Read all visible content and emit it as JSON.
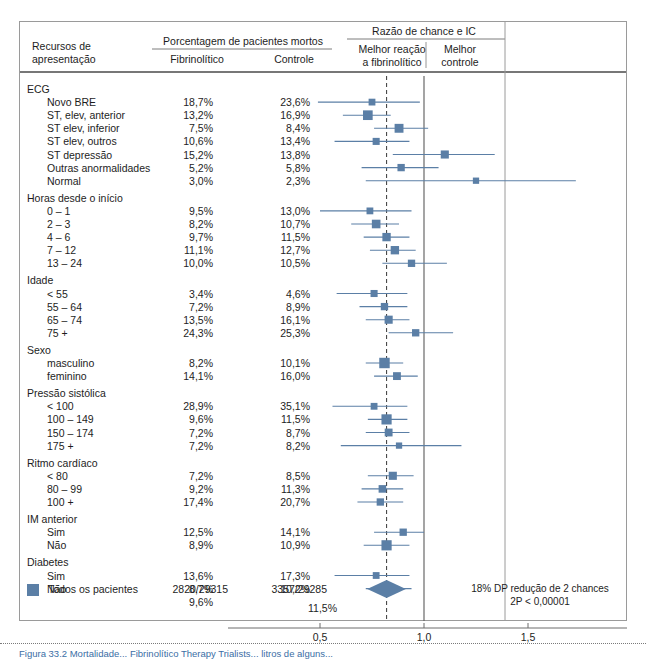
{
  "figure": {
    "type": "forest-plot",
    "accent_color": "#5b7fa6",
    "caption_partial": "Figura 33.2 Mortalidade... Fibrinolítico Therapy Trialists... litros de alguns..."
  },
  "headers": {
    "col_subject_line1": "Recursos de",
    "col_subject_line2": "apresentação",
    "pct_group": "Porcentagem de pacientes mortos",
    "pct_fibrino": "Fibrinolítico",
    "pct_control": "Controle",
    "or_group": "Razão de chance e IC",
    "or_left_line1": "Melhor reação",
    "or_left_line2": "a fibrinolítico",
    "or_right_line1": "Melhor",
    "or_right_line2": "controle"
  },
  "axis": {
    "ticks": [
      "0,5",
      "1,0",
      "1,5"
    ],
    "tick_values": [
      0.5,
      1.0,
      1.5
    ],
    "null_line": 1.0,
    "pooled_line": 0.82
  },
  "summary": {
    "legend_label": "Todos os pacientes",
    "fibrino_counts": "2820/29315",
    "control_counts": "3357/29285",
    "fibrino_pct": "9,6%",
    "control_pct": "11,5%",
    "note_line1": "18% DP redução de 2 chances",
    "note_line2": "2P < 0,00001",
    "or": 0.82,
    "ci_low": 0.78,
    "ci_high": 0.86
  },
  "chart_data": {
    "type": "forest",
    "title": "Razão de chance e IC",
    "xlabel": "",
    "ylabel": "",
    "xlim": [
      0.25,
      1.75
    ],
    "xticks": [
      0.5,
      1.0,
      1.5
    ],
    "xtick_labels": [
      "0,5",
      "1,0",
      "1,5"
    ],
    "grid": false,
    "legend": "none",
    "columns": [
      "Recursos de apresentação",
      "Fibrinolítico",
      "Controle",
      "Razão de chance e IC"
    ],
    "groups": [
      {
        "name": "ECG",
        "rows": [
          {
            "label": "Novo BRE",
            "fibrino": "18,7%",
            "control": "23,6%",
            "or": 0.75,
            "ci_low": 0.49,
            "ci_high": 0.98,
            "weight": 1.0
          },
          {
            "label": "ST, elev, anterior",
            "fibrino": "13,2%",
            "control": "16,9%",
            "or": 0.73,
            "ci_low": 0.61,
            "ci_high": 0.84,
            "weight": 2.1
          },
          {
            "label": "ST elev, inferior",
            "fibrino": "7,5%",
            "control": "8,4%",
            "or": 0.88,
            "ci_low": 0.76,
            "ci_high": 1.02,
            "weight": 1.8
          },
          {
            "label": "ST elev, outros",
            "fibrino": "10,6%",
            "control": "13,4%",
            "or": 0.77,
            "ci_low": 0.57,
            "ci_high": 0.93,
            "weight": 1.1
          },
          {
            "label": "ST depressão",
            "fibrino": "15,2%",
            "control": "13,8%",
            "or": 1.1,
            "ci_low": 0.85,
            "ci_high": 1.34,
            "weight": 1.5
          },
          {
            "label": "Outras anormalidades",
            "fibrino": "5,2%",
            "control": "5,8%",
            "or": 0.89,
            "ci_low": 0.7,
            "ci_high": 1.07,
            "weight": 1.2
          },
          {
            "label": "Normal",
            "fibrino": "3,0%",
            "control": "2,3%",
            "or": 1.25,
            "ci_low": 0.72,
            "ci_high": 1.73,
            "weight": 0.8
          }
        ]
      },
      {
        "name": "Horas desde o início",
        "rows": [
          {
            "label": "0 – 1",
            "fibrino": "9,5%",
            "control": "13,0%",
            "or": 0.74,
            "ci_low": 0.5,
            "ci_high": 0.94,
            "weight": 1.0
          },
          {
            "label": "2 – 3",
            "fibrino": "8,2%",
            "control": "10,7%",
            "or": 0.77,
            "ci_low": 0.65,
            "ci_high": 0.88,
            "weight": 1.7
          },
          {
            "label": "4 – 6",
            "fibrino": "9,7%",
            "control": "11,5%",
            "or": 0.82,
            "ci_low": 0.71,
            "ci_high": 0.93,
            "weight": 1.6
          },
          {
            "label": "7 – 12",
            "fibrino": "11,1%",
            "control": "12,7%",
            "or": 0.86,
            "ci_low": 0.74,
            "ci_high": 0.96,
            "weight": 1.6
          },
          {
            "label": "13 – 24",
            "fibrino": "10,0%",
            "control": "10,5%",
            "or": 0.94,
            "ci_low": 0.8,
            "ci_high": 1.11,
            "weight": 1.2
          }
        ]
      },
      {
        "name": "Idade",
        "rows": [
          {
            "label": "< 55",
            "fibrino": "3,4%",
            "control": "4,6%",
            "or": 0.76,
            "ci_low": 0.58,
            "ci_high": 0.92,
            "weight": 1.1
          },
          {
            "label": "55 – 64",
            "fibrino": "7,2%",
            "control": "8,9%",
            "or": 0.81,
            "ci_low": 0.69,
            "ci_high": 0.92,
            "weight": 1.2
          },
          {
            "label": "65 – 74",
            "fibrino": "13,5%",
            "control": "16,1%",
            "or": 0.83,
            "ci_low": 0.72,
            "ci_high": 0.93,
            "weight": 1.5
          },
          {
            "label": "75 +",
            "fibrino": "24,3%",
            "control": "25,3%",
            "or": 0.96,
            "ci_low": 0.83,
            "ci_high": 1.14,
            "weight": 1.2
          }
        ]
      },
      {
        "name": "Sexo",
        "rows": [
          {
            "label": "masculino",
            "fibrino": "8,2%",
            "control": "10,1%",
            "or": 0.81,
            "ci_low": 0.72,
            "ci_high": 0.9,
            "weight": 2.4
          },
          {
            "label": "feminino",
            "fibrino": "14,1%",
            "control": "16,0%",
            "or": 0.87,
            "ci_low": 0.76,
            "ci_high": 0.97,
            "weight": 1.4
          }
        ]
      },
      {
        "name": "Pressão sistólica",
        "rows": [
          {
            "label": "< 100",
            "fibrino": "28,9%",
            "control": "35,1%",
            "or": 0.76,
            "ci_low": 0.56,
            "ci_high": 0.92,
            "weight": 1.0
          },
          {
            "label": "100 – 149",
            "fibrino": "9,6%",
            "control": "11,5%",
            "or": 0.82,
            "ci_low": 0.73,
            "ci_high": 0.92,
            "weight": 2.3
          },
          {
            "label": "150 – 174",
            "fibrino": "7,2%",
            "control": "8,7%",
            "or": 0.83,
            "ci_low": 0.72,
            "ci_high": 0.93,
            "weight": 1.4
          },
          {
            "label": "175 +",
            "fibrino": "7,2%",
            "control": "8,2%",
            "or": 0.88,
            "ci_low": 0.6,
            "ci_high": 1.18,
            "weight": 0.8
          }
        ]
      },
      {
        "name": "Ritmo cardíaco",
        "rows": [
          {
            "label": "< 80",
            "fibrino": "7,2%",
            "control": "8,5%",
            "or": 0.85,
            "ci_low": 0.73,
            "ci_high": 0.95,
            "weight": 1.5
          },
          {
            "label": "80 – 99",
            "fibrino": "9,2%",
            "control": "11,3%",
            "or": 0.8,
            "ci_low": 0.7,
            "ci_high": 0.9,
            "weight": 1.3
          },
          {
            "label": "100 +",
            "fibrino": "17,4%",
            "control": "20,7%",
            "or": 0.79,
            "ci_low": 0.68,
            "ci_high": 0.9,
            "weight": 1.2
          }
        ]
      },
      {
        "name": "IM anterior",
        "rows": [
          {
            "label": "Sim",
            "fibrino": "12,5%",
            "control": "14,1%",
            "or": 0.9,
            "ci_low": 0.76,
            "ci_high": 1.0,
            "weight": 1.2
          },
          {
            "label": "Não",
            "fibrino": "8,9%",
            "control": "10,9%",
            "or": 0.82,
            "ci_low": 0.71,
            "ci_high": 0.93,
            "weight": 2.3
          }
        ]
      },
      {
        "name": "Diabetes",
        "rows": [
          {
            "label": "Sim",
            "fibrino": "13,6%",
            "control": "17,3%",
            "or": 0.77,
            "ci_low": 0.57,
            "ci_high": 0.93,
            "weight": 1.0
          },
          {
            "label": "Não",
            "fibrino": "8,7%",
            "control": "10,2%",
            "or": 0.83,
            "ci_low": 0.72,
            "ci_high": 0.94,
            "weight": 1.7
          }
        ]
      }
    ]
  }
}
